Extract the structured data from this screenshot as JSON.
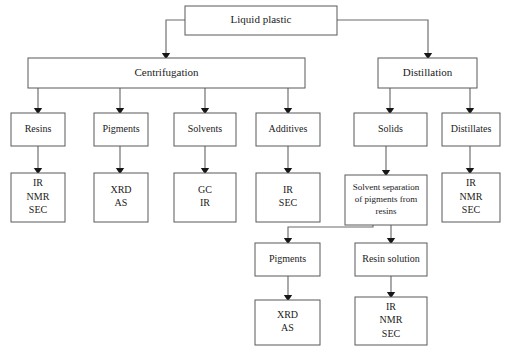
{
  "diagram": {
    "type": "flowchart",
    "background_color": "#ffffff",
    "box_border_color": "#59595b",
    "connector_color": "#6b6b6d",
    "text_color": "#1b1b1b"
  },
  "nodes": {
    "liquid_plastic": {
      "label": "Liquid plastic",
      "x": 185,
      "y": 6,
      "w": 152,
      "h": 29,
      "font_size": 11
    },
    "centrifugation": {
      "label": "Centrifugation",
      "x": 28,
      "y": 58,
      "w": 277,
      "h": 30,
      "font_size": 11
    },
    "distillation": {
      "label": "Distillation",
      "x": 378,
      "y": 58,
      "w": 99,
      "h": 30,
      "font_size": 11
    },
    "resins": {
      "label": "Resins",
      "x": 11,
      "y": 113,
      "w": 54,
      "h": 33,
      "font_size": 10
    },
    "pigments_centrifuge": {
      "label": "Pigments",
      "x": 94,
      "y": 113,
      "w": 54,
      "h": 33,
      "font_size": 10
    },
    "solvents": {
      "label": "Solvents",
      "x": 174,
      "y": 113,
      "w": 62,
      "h": 33,
      "font_size": 10
    },
    "additives": {
      "label": "Additives",
      "x": 256,
      "y": 113,
      "w": 64,
      "h": 33,
      "font_size": 10
    },
    "solids": {
      "label": "Solids",
      "x": 354,
      "y": 113,
      "w": 73,
      "h": 33,
      "font_size": 10
    },
    "distillates": {
      "label": "Distillates",
      "x": 442,
      "y": 113,
      "w": 58,
      "h": 33,
      "font_size": 10
    },
    "resins_methods": {
      "lines": [
        "IR",
        "NMR",
        "SEC"
      ],
      "x": 11,
      "y": 173,
      "w": 54,
      "h": 49,
      "font_size": 10
    },
    "pigments_methods": {
      "lines": [
        "XRD",
        "AS"
      ],
      "x": 94,
      "y": 173,
      "w": 54,
      "h": 49,
      "font_size": 10
    },
    "solvents_methods": {
      "lines": [
        "GC",
        "IR"
      ],
      "x": 174,
      "y": 173,
      "w": 62,
      "h": 49,
      "font_size": 10
    },
    "additives_methods": {
      "lines": [
        "IR",
        "SEC"
      ],
      "x": 256,
      "y": 173,
      "w": 64,
      "h": 49,
      "font_size": 10
    },
    "solvent_separation": {
      "lines": [
        "Solvent separation",
        "of pigments from",
        "resins"
      ],
      "x": 345,
      "y": 175,
      "w": 82,
      "h": 50,
      "font_size": 9
    },
    "distillates_methods": {
      "lines": [
        "IR",
        "NMR",
        "SEC"
      ],
      "x": 442,
      "y": 173,
      "w": 58,
      "h": 49,
      "font_size": 10
    },
    "pigments_secondary": {
      "label": "Pigments",
      "x": 255,
      "y": 243,
      "w": 65,
      "h": 33,
      "font_size": 10
    },
    "resin_solution": {
      "label": "Resin solution",
      "x": 355,
      "y": 243,
      "w": 72,
      "h": 33,
      "font_size": 10
    },
    "pigments_secondary_methods": {
      "lines": [
        "XRD",
        "AS"
      ],
      "x": 255,
      "y": 300,
      "w": 65,
      "h": 45,
      "font_size": 10
    },
    "resin_solution_methods": {
      "lines": [
        "IR",
        "NMR",
        "SEC"
      ],
      "x": 355,
      "y": 297,
      "w": 72,
      "h": 48,
      "font_size": 10
    }
  },
  "edges": [
    {
      "name": "liquid-plastic-to-centrifugation",
      "from": "liquid_plastic",
      "to": "centrifugation",
      "path": "M185,20 L166,20 L166,53"
    },
    {
      "name": "liquid-plastic-to-distillation",
      "from": "liquid_plastic",
      "to": "distillation",
      "path": "M337,20 L428,20 L428,53"
    },
    {
      "name": "centrifugation-to-resins",
      "from": "centrifugation",
      "to": "resins",
      "path": "M38,88 L38,108"
    },
    {
      "name": "centrifugation-to-pigments",
      "from": "centrifugation",
      "to": "pigments_centrifuge",
      "path": "M120,88 L120,108"
    },
    {
      "name": "centrifugation-to-solvents",
      "from": "centrifugation",
      "to": "solvents",
      "path": "M205,88 L205,108"
    },
    {
      "name": "centrifugation-to-additives",
      "from": "centrifugation",
      "to": "additives",
      "path": "M288,88 L288,108"
    },
    {
      "name": "distillation-to-solids",
      "from": "distillation",
      "to": "solids",
      "path": "M390,88 L390,108"
    },
    {
      "name": "distillation-to-distillates",
      "from": "distillation",
      "to": "distillates",
      "path": "M470,88 L470,108"
    },
    {
      "name": "resins-to-methods",
      "from": "resins",
      "to": "resins_methods",
      "path": "M38,146 L38,168"
    },
    {
      "name": "pigments-to-methods",
      "from": "pigments_centrifuge",
      "to": "pigments_methods",
      "path": "M120,146 L120,168"
    },
    {
      "name": "solvents-to-methods",
      "from": "solvents",
      "to": "solvents_methods",
      "path": "M205,146 L205,168"
    },
    {
      "name": "additives-to-methods",
      "from": "additives",
      "to": "additives_methods",
      "path": "M288,146 L288,168"
    },
    {
      "name": "solids-to-solvent-separation",
      "from": "solids",
      "to": "solvent_separation",
      "path": "M386,146 L386,170"
    },
    {
      "name": "distillates-to-methods",
      "from": "distillates",
      "to": "distillates_methods",
      "path": "M470,146 L470,168"
    },
    {
      "name": "solvent-separation-to-pigments",
      "from": "solvent_separation",
      "to": "pigments_secondary",
      "path": "M373,225 L373,227 L288,227 L288,238"
    },
    {
      "name": "solvent-separation-to-resin-solution",
      "from": "solvent_separation",
      "to": "resin_solution",
      "path": "M391,225 L391,238"
    },
    {
      "name": "pigments-secondary-to-methods",
      "from": "pigments_secondary",
      "to": "pigments_secondary_methods",
      "path": "M288,276 L288,295"
    },
    {
      "name": "resin-solution-to-methods",
      "from": "resin_solution",
      "to": "resin_solution_methods",
      "path": "M391,276 L391,292"
    }
  ]
}
